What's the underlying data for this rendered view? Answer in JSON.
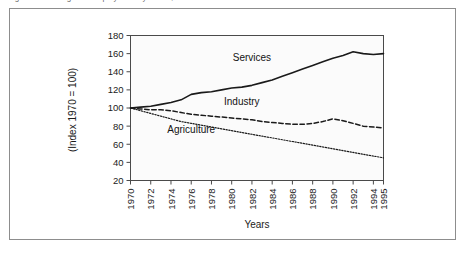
{
  "figure": {
    "caption": "Figure 2.3   Changes in employment by sector, 1970–1995",
    "caption_visible": "partially cropped at top edge"
  },
  "chart_data": {
    "type": "line",
    "title": "",
    "xlabel": "Years",
    "ylabel": "(Index 1970 = 100)",
    "xlim": [
      1970,
      1995
    ],
    "ylim": [
      20,
      180
    ],
    "ytick_step": 20,
    "grid": false,
    "legend_position": "inline-labels",
    "yticks": [
      20,
      40,
      60,
      80,
      100,
      120,
      140,
      160,
      180
    ],
    "categories": [
      1970,
      1971,
      1972,
      1973,
      1974,
      1975,
      1976,
      1977,
      1978,
      1979,
      1980,
      1981,
      1982,
      1983,
      1984,
      1985,
      1986,
      1987,
      1988,
      1989,
      1990,
      1991,
      1992,
      1993,
      1994,
      1995
    ],
    "xtick_labels": [
      "1970",
      "1972",
      "1974",
      "1976",
      "1978",
      "1980",
      "1982",
      "1984",
      "1986",
      "1988",
      "1990",
      "1992",
      "1994",
      "1995"
    ],
    "xtick_values": [
      1970,
      1972,
      1974,
      1976,
      1978,
      1980,
      1982,
      1984,
      1986,
      1988,
      1990,
      1992,
      1994,
      1995
    ],
    "series": [
      {
        "name": "Services",
        "style": "solid",
        "color": "#1a1a1a",
        "label_x": 1982,
        "label_y": 152,
        "values": [
          100,
          101,
          102,
          104,
          106,
          109,
          115,
          117,
          118,
          120,
          122,
          123,
          125,
          128,
          131,
          135,
          139,
          143,
          147,
          151,
          155,
          158,
          162,
          160,
          159,
          160
        ]
      },
      {
        "name": "Industry",
        "style": "dashed",
        "color": "#1a1a1a",
        "label_x": 1981,
        "label_y": 103,
        "values": [
          100,
          99,
          98,
          98,
          97,
          95,
          93,
          92,
          91,
          90,
          89,
          88,
          87,
          85,
          84,
          83,
          82,
          82,
          83,
          85,
          88,
          86,
          83,
          80,
          79,
          78
        ]
      },
      {
        "name": "Agriculture",
        "style": "dotted",
        "color": "#1a1a1a",
        "label_x": 1976,
        "label_y": 72,
        "values": [
          100,
          97,
          94,
          91,
          88,
          85,
          83,
          81,
          79,
          77,
          75,
          73,
          71,
          69,
          67,
          65,
          63,
          61,
          59,
          57,
          55,
          53,
          51,
          49,
          47,
          45
        ]
      }
    ]
  }
}
